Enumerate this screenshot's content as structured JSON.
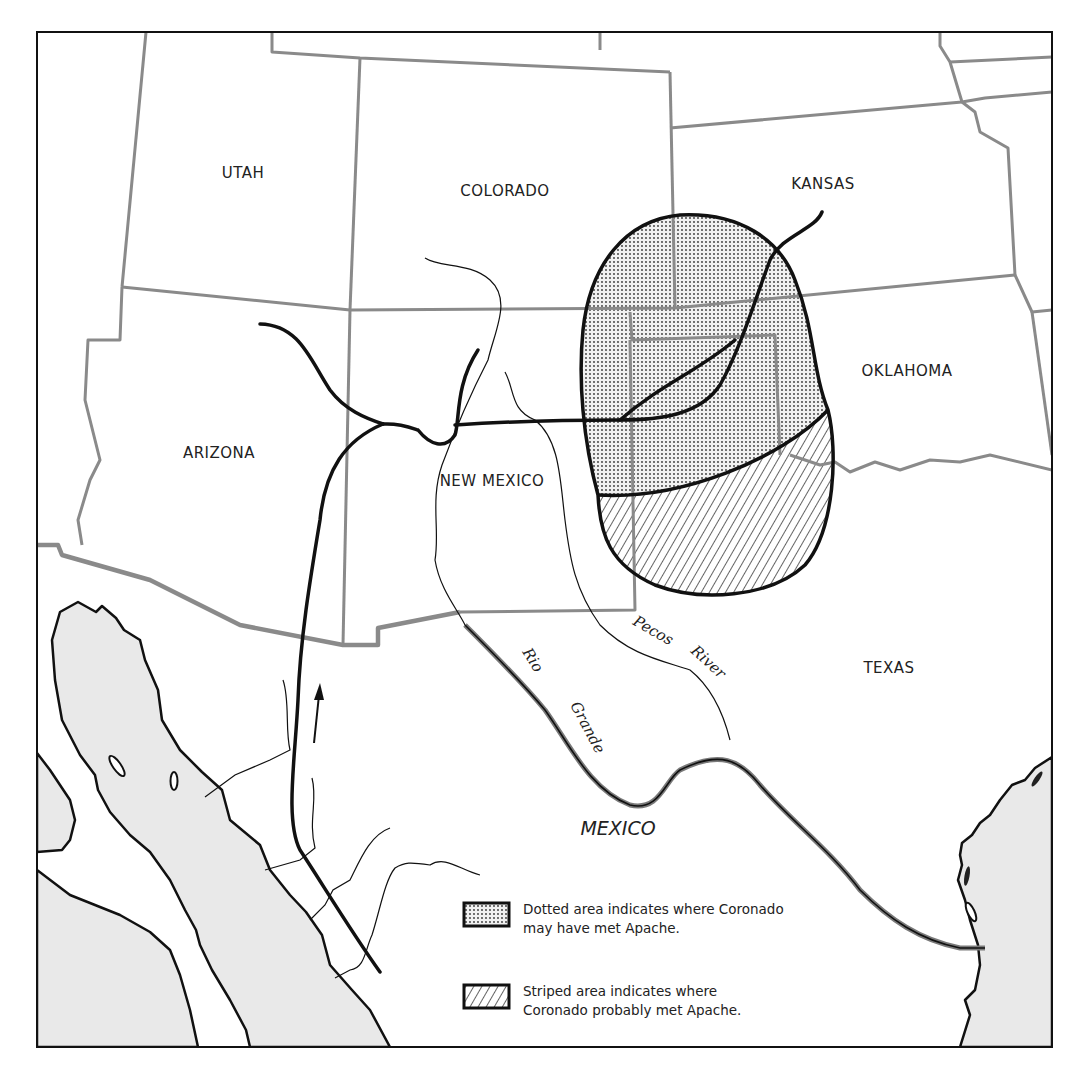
{
  "map": {
    "colors": {
      "border": "#8a8a8a",
      "route": "#111111",
      "water": "#e9e9e9",
      "dotted_fill": "#dcdcdc"
    },
    "states": [
      {
        "name": "UTAH",
        "x": 243,
        "y": 178
      },
      {
        "name": "COLORADO",
        "x": 505,
        "y": 196
      },
      {
        "name": "KANSAS",
        "x": 823,
        "y": 189
      },
      {
        "name": "OKLAHOMA",
        "x": 907,
        "y": 376
      },
      {
        "name": "ARIZONA",
        "x": 219,
        "y": 458
      },
      {
        "name": "NEW MEXICO",
        "x": 492,
        "y": 486
      },
      {
        "name": "TEXAS",
        "x": 889,
        "y": 673
      }
    ],
    "countries": [
      {
        "name": "MEXICO",
        "x": 618,
        "y": 835
      }
    ],
    "rivers": [
      {
        "name_part1": "Rio",
        "name_part2": "Grande"
      },
      {
        "name_part1": "Pecos",
        "name_part2": "River"
      }
    ],
    "route_direction_icon": "arrow-up-icon",
    "legend": {
      "items": [
        {
          "pattern": "dotted",
          "line1": "Dotted area indicates where Coronado",
          "line2": "may have met Apache."
        },
        {
          "pattern": "striped",
          "line1": "Striped area indicates where",
          "line2": "Coronado probably met Apache."
        }
      ]
    }
  }
}
